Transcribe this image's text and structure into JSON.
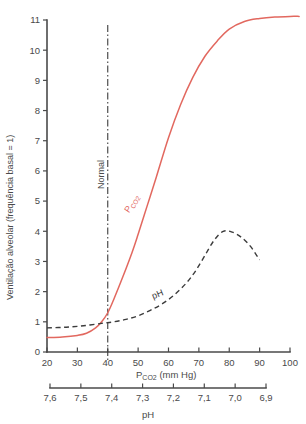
{
  "chart_data": {
    "type": "line",
    "title": "",
    "xlabel": "Pco2 (mm Hg)",
    "xlabel_main": "P",
    "xlabel_sub": "CO",
    "xlabel_sub2": "2",
    "xlabel_tail": " (mm Hg)",
    "ylabel": "Ventilação alveolar (frequência basal = 1)",
    "xlim": [
      20,
      100
    ],
    "ylim": [
      0,
      11
    ],
    "grid": false,
    "legend_position": "inline-annotations",
    "x_ticks": [
      "20",
      "30",
      "40",
      "50",
      "60",
      "70",
      "80",
      "90",
      "100"
    ],
    "x_tick_values": [
      20,
      30,
      40,
      50,
      60,
      70,
      80,
      90,
      100
    ],
    "y_ticks": [
      "0",
      "1",
      "2",
      "3",
      "4",
      "5",
      "6",
      "7",
      "8",
      "9",
      "10",
      "11"
    ],
    "y_tick_values": [
      0,
      1,
      2,
      3,
      4,
      5,
      6,
      7,
      8,
      9,
      10,
      11
    ],
    "secondary_axis": {
      "label": "pH",
      "ticks": [
        "7,6",
        "7,5",
        "7,4",
        "7,3",
        "7,2",
        "7,1",
        "7,0",
        "6,9"
      ],
      "tick_values": [
        7.6,
        7.5,
        7.4,
        7.3,
        7.2,
        7.1,
        7.0,
        6.9
      ]
    },
    "annotations": [
      {
        "text": "Normal",
        "x": 40,
        "y": 5.4,
        "rotation": -90
      },
      {
        "text": "Pco2",
        "x": 47,
        "y": 4.6,
        "rotation": -58,
        "color": "#e2685f"
      },
      {
        "text": "pH",
        "x": 55,
        "y": 1.75,
        "rotation": -22
      }
    ],
    "reference_line": {
      "name": "Normal",
      "x": 40
    },
    "series": [
      {
        "name": "Pco2",
        "style": "solid",
        "color": "#e2685f",
        "x": [
          20,
          25,
          30,
          33,
          36,
          38,
          40,
          42,
          45,
          48,
          50,
          53,
          56,
          60,
          64,
          68,
          72,
          76,
          80,
          85,
          90,
          95,
          100,
          103
        ],
        "values": [
          0.48,
          0.5,
          0.55,
          0.62,
          0.8,
          1.0,
          1.3,
          1.75,
          2.5,
          3.3,
          3.9,
          4.85,
          5.8,
          7.1,
          8.2,
          9.1,
          9.8,
          10.3,
          10.7,
          10.95,
          11.05,
          11.1,
          11.12,
          11.12
        ]
      },
      {
        "name": "pH",
        "style": "dashed",
        "color": "#3c3c3c",
        "x": [
          20,
          26,
          32,
          38,
          42,
          46,
          50,
          54,
          58,
          62,
          66,
          69,
          72,
          75,
          78,
          81,
          84,
          87,
          90
        ],
        "values": [
          0.8,
          0.82,
          0.87,
          0.95,
          1.0,
          1.08,
          1.2,
          1.38,
          1.6,
          1.9,
          2.3,
          2.7,
          3.2,
          3.7,
          4.0,
          3.97,
          3.8,
          3.5,
          3.05
        ]
      }
    ]
  },
  "axes": {
    "y_axis_title": "Ventilação alveolar (frequência basal = 1)",
    "x_axis_title_prefix": "P",
    "x_axis_title_sub": "CO",
    "x_axis_title_sub_num": "2",
    "x_axis_title_suffix": " (mm Hg)",
    "ph_axis_title": "pH"
  },
  "labels": {
    "normal": "Normal",
    "pco2_prefix": "P",
    "pco2_sub": "CO",
    "pco2_sub_num": "2",
    "ph": "pH"
  }
}
